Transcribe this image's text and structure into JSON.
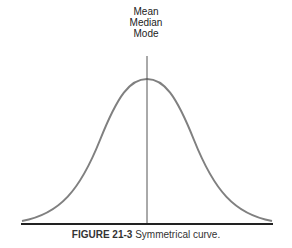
{
  "labels": {
    "line1": "Mean",
    "line2": "Median",
    "line3": "Mode"
  },
  "caption": {
    "figure": "FIGURE 21-3",
    "text": "Symmetrical curve."
  },
  "colors": {
    "curve": "#808080",
    "axis": "#222222",
    "center_line": "#555555"
  }
}
